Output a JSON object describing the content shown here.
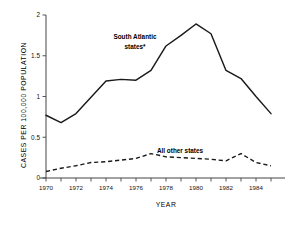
{
  "chart_data": {
    "type": "line",
    "title": "",
    "xlabel": "YEAR",
    "ylabel": "CASES PER 100,000 POPULATION",
    "x": [
      1970,
      1971,
      1972,
      1973,
      1974,
      1975,
      1976,
      1977,
      1978,
      1979,
      1980,
      1981,
      1982,
      1983,
      1984,
      1985
    ],
    "xlim": [
      1970,
      1985
    ],
    "ylim": [
      0,
      2
    ],
    "xticks": [
      1970,
      1971,
      1972,
      1973,
      1974,
      1975,
      1976,
      1977,
      1978,
      1979,
      1980,
      1981,
      1982,
      1983,
      1984,
      1985
    ],
    "xtick_labels": [
      "1970",
      "",
      "1972",
      "",
      "1974",
      "",
      "1976",
      "",
      "1978",
      "",
      "1980",
      "",
      "1982",
      "",
      "1984",
      ""
    ],
    "yticks": [
      0,
      0.5,
      1,
      1.5,
      2
    ],
    "ytick_labels": [
      "0",
      "0.5",
      "1",
      "1.5",
      "2"
    ],
    "grid": false,
    "legend_position": "inline-annotations",
    "series": [
      {
        "name": "South Atlantic states*",
        "style": "solid",
        "label_line1": "South Atlantic",
        "label_line2": "states*",
        "values": [
          0.77,
          0.68,
          0.79,
          0.99,
          1.19,
          1.21,
          1.2,
          1.32,
          1.62,
          1.75,
          1.89,
          1.77,
          1.32,
          1.22,
          1.0,
          0.79
        ]
      },
      {
        "name": "All other states",
        "style": "dashed",
        "label_line1": "All other states",
        "values": [
          0.08,
          0.12,
          0.15,
          0.19,
          0.2,
          0.22,
          0.24,
          0.3,
          0.26,
          0.25,
          0.24,
          0.23,
          0.21,
          0.3,
          0.19,
          0.15
        ]
      }
    ]
  },
  "axes": {
    "y_axis_label": "CASES PER 100,000 POPULATION",
    "x_axis_label": "YEAR"
  }
}
